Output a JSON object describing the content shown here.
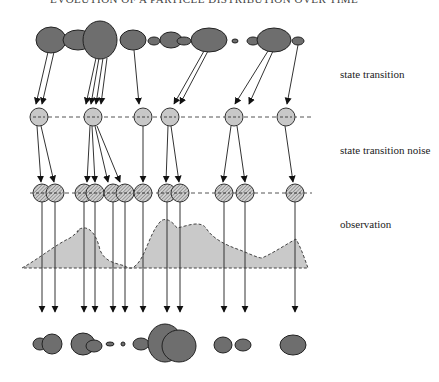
{
  "title": "EVOLUTION OF A PARTICLE DISTRIBUTION OVER TIME",
  "labels": {
    "state_transition": "state transition",
    "state_transition_noise": "state transition noise",
    "observation": "observation"
  },
  "colors": {
    "particle_fill": "#6e6e6e",
    "particle_stroke": "#222222",
    "state_fill": "#c8c8c8",
    "noise_fill": "#b4b4b4",
    "observation_fill": "#c9c9c9",
    "line": "#333333",
    "dash": "#555555"
  },
  "top_particles": [
    {
      "cx": 51,
      "cy": 40,
      "rx": 15,
      "ry": 13
    },
    {
      "cx": 78,
      "cy": 40,
      "rx": 15,
      "ry": 10
    },
    {
      "cx": 100,
      "cy": 40,
      "rx": 17,
      "ry": 19
    },
    {
      "cx": 133,
      "cy": 40,
      "rx": 13,
      "ry": 10
    },
    {
      "cx": 154,
      "cy": 41,
      "rx": 6,
      "ry": 4
    },
    {
      "cx": 171,
      "cy": 40,
      "rx": 11,
      "ry": 8
    },
    {
      "cx": 184,
      "cy": 41,
      "rx": 7,
      "ry": 4
    },
    {
      "cx": 209,
      "cy": 40,
      "rx": 18,
      "ry": 12
    },
    {
      "cx": 235,
      "cy": 41,
      "rx": 3,
      "ry": 2
    },
    {
      "cx": 253,
      "cy": 41,
      "rx": 6,
      "ry": 4
    },
    {
      "cx": 274,
      "cy": 40,
      "rx": 17,
      "ry": 12
    },
    {
      "cx": 298,
      "cy": 41,
      "rx": 6,
      "ry": 4
    }
  ],
  "transition_arrows": [
    {
      "x1": 48,
      "y1": 52,
      "x2": 36,
      "y2": 104
    },
    {
      "x1": 54,
      "y1": 52,
      "x2": 42,
      "y2": 104
    },
    {
      "x1": 96,
      "y1": 58,
      "x2": 86,
      "y2": 104
    },
    {
      "x1": 99,
      "y1": 58,
      "x2": 91,
      "y2": 104
    },
    {
      "x1": 103,
      "y1": 58,
      "x2": 96,
      "y2": 104
    },
    {
      "x1": 107,
      "y1": 58,
      "x2": 101,
      "y2": 104
    },
    {
      "x1": 134,
      "y1": 50,
      "x2": 139,
      "y2": 104
    },
    {
      "x1": 204,
      "y1": 51,
      "x2": 174,
      "y2": 104
    },
    {
      "x1": 208,
      "y1": 51,
      "x2": 180,
      "y2": 104
    },
    {
      "x1": 268,
      "y1": 51,
      "x2": 235,
      "y2": 104
    },
    {
      "x1": 273,
      "y1": 51,
      "x2": 249,
      "y2": 104
    },
    {
      "x1": 298,
      "y1": 45,
      "x2": 287,
      "y2": 104
    }
  ],
  "state_circles": {
    "cy": 117,
    "r": 9,
    "xs": [
      39,
      93,
      143,
      170,
      234,
      286
    ]
  },
  "state_dash_line": {
    "x1": 48,
    "x2": 312,
    "y": 117
  },
  "noise_arrows": [
    {
      "x1": 37,
      "y1": 126,
      "x2": 41,
      "y2": 182
    },
    {
      "x1": 41,
      "y1": 126,
      "x2": 54,
      "y2": 182
    },
    {
      "x1": 90,
      "y1": 126,
      "x2": 87,
      "y2": 182
    },
    {
      "x1": 92,
      "y1": 126,
      "x2": 95,
      "y2": 182
    },
    {
      "x1": 95,
      "y1": 126,
      "x2": 108,
      "y2": 182
    },
    {
      "x1": 97,
      "y1": 126,
      "x2": 120,
      "y2": 182
    },
    {
      "x1": 143,
      "y1": 126,
      "x2": 143,
      "y2": 182
    },
    {
      "x1": 168,
      "y1": 126,
      "x2": 166,
      "y2": 182
    },
    {
      "x1": 171,
      "y1": 126,
      "x2": 179,
      "y2": 182
    },
    {
      "x1": 231,
      "y1": 126,
      "x2": 223,
      "y2": 182
    },
    {
      "x1": 237,
      "y1": 126,
      "x2": 245,
      "y2": 182
    },
    {
      "x1": 285,
      "y1": 126,
      "x2": 293,
      "y2": 182
    }
  ],
  "noise_circles": {
    "cy": 193,
    "r": 9,
    "xs": [
      42,
      55,
      84,
      95,
      113,
      125,
      143,
      167,
      180,
      224,
      245,
      295
    ]
  },
  "noise_dash_line": {
    "x1": 30,
    "x2": 312,
    "y": 193
  },
  "observation_area": {
    "baseline_y": 268,
    "path": "M 22 268 C 40 258, 55 245, 70 238 C 78 232, 82 228, 77 232 L 78 230 C 85 225, 95 228, 100 250 C 105 262, 115 263, 125 266 L 128 268 L 132 268 C 145 262, 148 235, 160 222 C 163 218, 170 218, 177 228 C 187 226, 200 220, 206 228 C 212 238, 225 245, 240 250 C 250 254, 258 258, 262 258 C 275 252, 285 245, 296 239 C 302 250, 305 260, 308 268 Z"
  },
  "observation_arrows": {
    "y1": 198,
    "y2": 312,
    "xs": [
      42,
      55,
      84,
      95,
      113,
      125,
      143,
      167,
      180,
      224,
      245,
      295
    ]
  },
  "bottom_particles": [
    {
      "cx": 40,
      "cy": 344,
      "rx": 7,
      "ry": 6
    },
    {
      "cx": 52,
      "cy": 344,
      "rx": 10,
      "ry": 10
    },
    {
      "cx": 83,
      "cy": 344,
      "rx": 12,
      "ry": 11
    },
    {
      "cx": 94,
      "cy": 346,
      "rx": 8,
      "ry": 6
    },
    {
      "cx": 110,
      "cy": 344,
      "rx": 4,
      "ry": 2
    },
    {
      "cx": 123,
      "cy": 344,
      "rx": 2,
      "ry": 2
    },
    {
      "cx": 141,
      "cy": 344,
      "rx": 8,
      "ry": 6
    },
    {
      "cx": 165,
      "cy": 343,
      "rx": 17,
      "ry": 19
    },
    {
      "cx": 179,
      "cy": 346,
      "rx": 17,
      "ry": 16
    },
    {
      "cx": 223,
      "cy": 345,
      "rx": 9,
      "ry": 8
    },
    {
      "cx": 243,
      "cy": 345,
      "rx": 8,
      "ry": 6
    },
    {
      "cx": 293,
      "cy": 345,
      "rx": 13,
      "ry": 10
    }
  ]
}
